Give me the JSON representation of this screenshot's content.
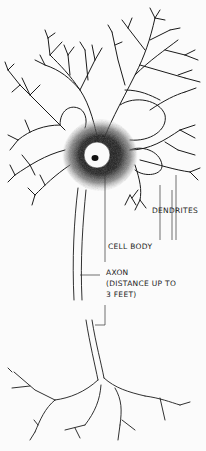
{
  "diagram": {
    "labels": {
      "dendrites": "DENDRITES",
      "cell_body": "CELL BODY",
      "axon_line1": "AXON",
      "axon_line2": "(DISTANCE UP TO",
      "axon_line3": "3 FEET)"
    },
    "colors": {
      "ink": "#1a1a1a",
      "background": "#fbfbfb"
    }
  }
}
